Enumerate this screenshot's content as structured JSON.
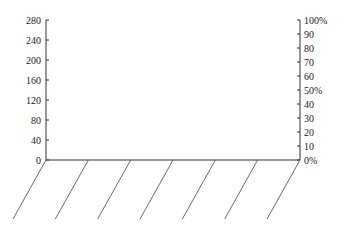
{
  "chart_data": {
    "type": "bar",
    "title": "",
    "xlabel": "",
    "ylabel": "",
    "categories": [
      "",
      "",
      "",
      "",
      "",
      "",
      ""
    ],
    "series": [],
    "left_axis": {
      "ticks": [
        0,
        40,
        80,
        120,
        160,
        200,
        240,
        280
      ],
      "labels": [
        "0",
        "40",
        "80",
        "120",
        "160",
        "200",
        "240",
        "280"
      ],
      "ylim": [
        0,
        280
      ]
    },
    "right_axis": {
      "ticks": [
        0,
        10,
        20,
        30,
        40,
        50,
        60,
        70,
        80,
        90,
        100
      ],
      "labels": [
        "0%",
        "10",
        "20",
        "30",
        "40",
        "50%",
        "60",
        "70",
        "80",
        "90",
        "100%"
      ],
      "ylim": [
        0,
        100
      ]
    },
    "grid": false,
    "legend": null,
    "slanted_category_dividers": 7
  },
  "colors": {
    "axis": "#333333",
    "text": "#222222",
    "background": "#ffffff"
  }
}
